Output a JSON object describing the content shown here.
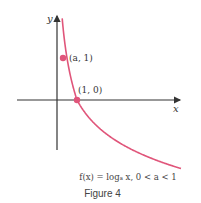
{
  "chart_data": {
    "type": "line",
    "title": "",
    "xlabel": "x",
    "ylabel": "y",
    "function": "f(x) = log_a x, 0 < a < 1",
    "a": 0.5,
    "series": [
      {
        "name": "f(x) = log_a x",
        "color": "#e0557a"
      }
    ],
    "points": [
      {
        "label": "(a, 1)",
        "x": 0.5,
        "y": 1
      },
      {
        "label": "(1, 0)",
        "x": 1,
        "y": 0
      }
    ],
    "xlim": [
      -2.0,
      5.2
    ],
    "ylim": [
      -3.0,
      4.0
    ],
    "grid": false
  },
  "caption": {
    "formula": "f(x) = logₐ x, 0 < a < 1",
    "figure": "Figure 4"
  },
  "colors": {
    "curve": "#e0557a",
    "axis": "#333333"
  }
}
